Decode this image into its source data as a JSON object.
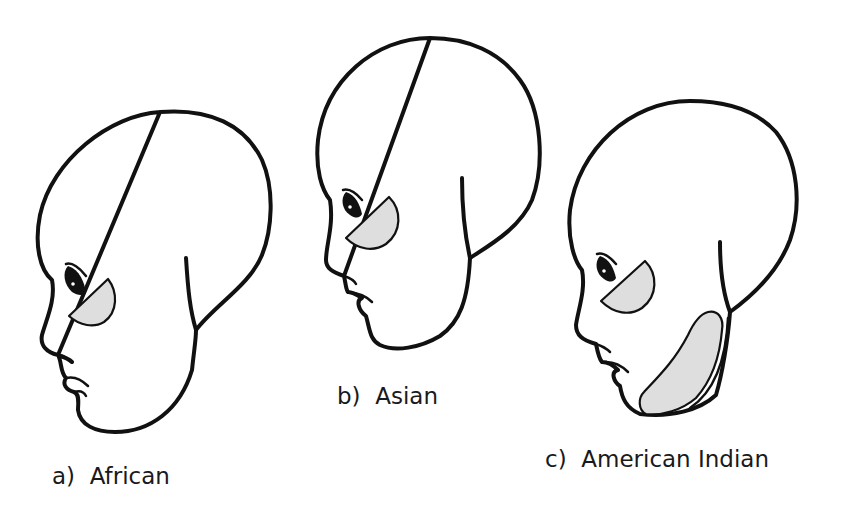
{
  "figure": {
    "shade_color": "#dedede",
    "line_color": "#111111",
    "panels": [
      {
        "id": "a",
        "label": "a)  African",
        "highlighted_regions": [
          "cheekbone"
        ]
      },
      {
        "id": "b",
        "label": "b)  Asian",
        "highlighted_regions": [
          "cheekbone"
        ]
      },
      {
        "id": "c",
        "label": "c)  American Indian",
        "highlighted_regions": [
          "cheekbone",
          "jaw"
        ]
      }
    ]
  }
}
